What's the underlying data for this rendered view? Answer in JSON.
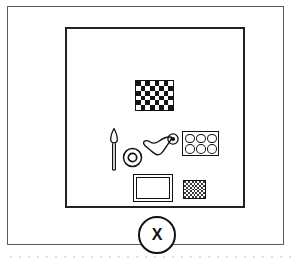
{
  "figure": {
    "type": "line-art-diagram",
    "background_color": "#ffffff",
    "ink_color": "#111111",
    "outer_frame": {
      "name": "outer page border",
      "border_color": "#5a5a5a"
    },
    "inner_board": {
      "name": "inner bordered square panel",
      "border_color": "#222222"
    },
    "callout": {
      "label": "X",
      "shape": "circle",
      "border_color": "#111111"
    },
    "objects": [
      {
        "id": "checkerboard-mat",
        "label": "checkerboard mat",
        "shape": "rectangle",
        "pattern": "checkerboard",
        "columns": 8,
        "rows": 6,
        "dark_color": "#151515",
        "light_color": "#ffffff"
      },
      {
        "id": "brush",
        "label": "brush",
        "shape": "brush with tapered tip and thin handle",
        "outline_color": "#111111"
      },
      {
        "id": "ring-large",
        "label": "large concentric ring",
        "shape": "donut",
        "outline_color": "#111111"
      },
      {
        "id": "wave-blob",
        "label": "wavy blob",
        "shape": "irregular curved outline",
        "outline_color": "#111111"
      },
      {
        "id": "ring-small",
        "label": "small concentric ring",
        "shape": "donut",
        "outline_color": "#111111"
      },
      {
        "id": "well-tray",
        "label": "tray with six round wells",
        "shape": "rectangle with circle grid",
        "columns": 3,
        "rows": 2,
        "well_count": 6,
        "outline_color": "#111111"
      },
      {
        "id": "picture-frame",
        "label": "double bordered frame",
        "shape": "rectangle with inner rectangle",
        "outline_color": "#111111"
      },
      {
        "id": "texture-square",
        "label": "fine textured square",
        "shape": "rectangle",
        "pattern": "fine checker dots",
        "columns": 11,
        "rows": 9,
        "dark_color": "#3a3a3a",
        "light_color": "#ffffff"
      }
    ]
  }
}
